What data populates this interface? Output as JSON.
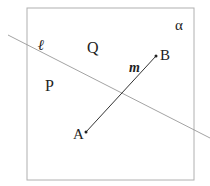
{
  "diagram": {
    "plane": {
      "label": "α",
      "color": "#aaaaaa"
    },
    "line_l": {
      "label": "ℓ",
      "color": "#999999"
    },
    "segment_m": {
      "label": "m",
      "color": "#333333"
    },
    "points": {
      "A": {
        "label": "A"
      },
      "B": {
        "label": "B"
      },
      "P": {
        "label": "P"
      },
      "Q": {
        "label": "Q"
      }
    }
  }
}
